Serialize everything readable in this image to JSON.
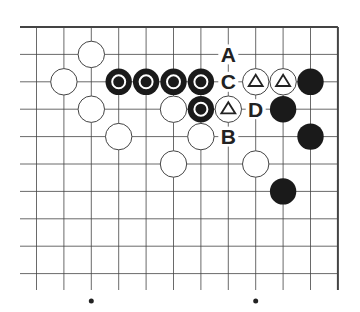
{
  "board": {
    "description": "Go problem diagram, top-right corner",
    "origin_x": 36.5,
    "origin_y": 27,
    "spacing": 27.4,
    "cols": 12,
    "rows": 11,
    "right_edge_col": 11,
    "top_edge_row": 0,
    "stone_radius": 13.2,
    "star_points": [
      [
        2,
        10
      ],
      [
        8,
        10
      ]
    ],
    "stones": [
      {
        "color": "white",
        "col": 2,
        "row": 1,
        "mark": ""
      },
      {
        "color": "white",
        "col": 1,
        "row": 2,
        "mark": ""
      },
      {
        "color": "black",
        "col": 3,
        "row": 2,
        "mark": "circle"
      },
      {
        "color": "black",
        "col": 4,
        "row": 2,
        "mark": "circle"
      },
      {
        "color": "black",
        "col": 5,
        "row": 2,
        "mark": "circle"
      },
      {
        "color": "black",
        "col": 6,
        "row": 2,
        "mark": "circle"
      },
      {
        "color": "white",
        "col": 8,
        "row": 2,
        "mark": "triangle"
      },
      {
        "color": "white",
        "col": 9,
        "row": 2,
        "mark": "triangle"
      },
      {
        "color": "black",
        "col": 10,
        "row": 2,
        "mark": ""
      },
      {
        "color": "white",
        "col": 2,
        "row": 3,
        "mark": ""
      },
      {
        "color": "white",
        "col": 5,
        "row": 3,
        "mark": ""
      },
      {
        "color": "black",
        "col": 6,
        "row": 3,
        "mark": "circle"
      },
      {
        "color": "white",
        "col": 7,
        "row": 3,
        "mark": "triangle"
      },
      {
        "color": "black",
        "col": 9,
        "row": 3,
        "mark": ""
      },
      {
        "color": "white",
        "col": 3,
        "row": 4,
        "mark": ""
      },
      {
        "color": "white",
        "col": 6,
        "row": 4,
        "mark": ""
      },
      {
        "color": "black",
        "col": 10,
        "row": 4,
        "mark": ""
      },
      {
        "color": "white",
        "col": 5,
        "row": 5,
        "mark": ""
      },
      {
        "color": "white",
        "col": 8,
        "row": 5,
        "mark": ""
      },
      {
        "color": "black",
        "col": 9,
        "row": 6,
        "mark": ""
      }
    ],
    "labels": [
      {
        "text": "A",
        "col": 7,
        "row": 1
      },
      {
        "text": "C",
        "col": 7,
        "row": 2
      },
      {
        "text": "D",
        "col": 8,
        "row": 3
      },
      {
        "text": "B",
        "col": 7,
        "row": 4
      }
    ],
    "colors": {
      "line": "#444444",
      "black_stone": "#1a1a1a",
      "white_stone": "#ffffff",
      "mark": "#ffffff",
      "label": "#222222"
    }
  }
}
